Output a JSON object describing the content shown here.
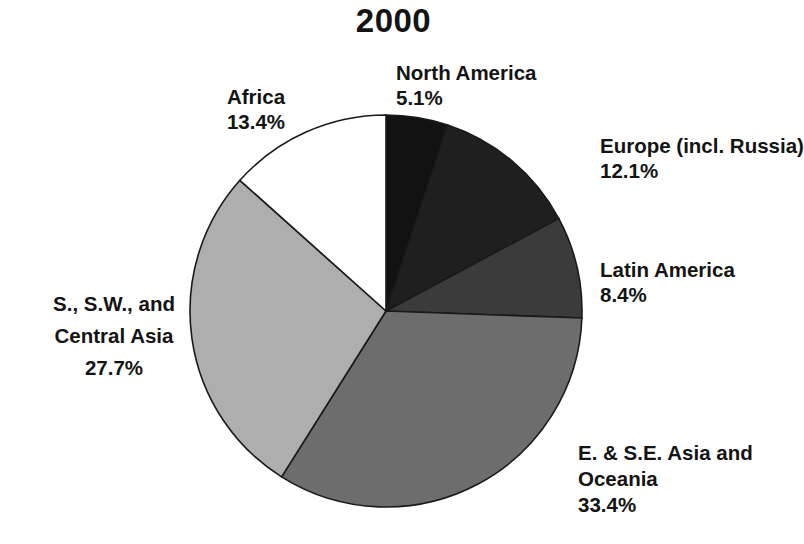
{
  "chart_data": {
    "type": "pie",
    "title": "2000",
    "xlabel": "",
    "ylabel": "",
    "legend_position": "labels-around-pie",
    "grid": false,
    "start_angle_deg": 0,
    "direction": "clockwise",
    "categories": [
      "North America",
      "Europe (incl. Russia)",
      "Latin America",
      "E. & S.E. Asia and Oceania",
      "S., S.W., and Central Asia",
      "Africa"
    ],
    "values": [
      5.1,
      12.1,
      8.4,
      33.4,
      27.7,
      13.4
    ],
    "value_labels": [
      "5.1%",
      "12.1%",
      "8.4%",
      "33.4%",
      "27.7%",
      "13.4%"
    ],
    "slice_colors": [
      "#121212",
      "#1f1f1f",
      "#3b3b3b",
      "#6d6d6d",
      "#aeaeae",
      "#ffffff"
    ],
    "slice_outline_color": "#1a1a1a"
  },
  "chart": {
    "title": "2000",
    "slices": [
      {
        "name": "north-america",
        "label": "North America",
        "pct": "5.1%",
        "value": 5.1,
        "color": "#121212"
      },
      {
        "name": "europe",
        "label": "Europe (incl. Russia)",
        "pct": "12.1%",
        "value": 12.1,
        "color": "#1f1f1f"
      },
      {
        "name": "latin-america",
        "label": "Latin America",
        "pct": "8.4%",
        "value": 8.4,
        "color": "#3b3b3b"
      },
      {
        "name": "ese-asia",
        "label": "E. & S.E. Asia and",
        "label2": "Oceania",
        "pct": "33.4%",
        "value": 33.4,
        "color": "#6d6d6d"
      },
      {
        "name": "s-asia",
        "label": "S., S.W., and",
        "label2": "Central Asia",
        "pct": "27.7%",
        "value": 27.7,
        "color": "#aeaeae"
      },
      {
        "name": "africa",
        "label": "Africa",
        "pct": "13.4%",
        "value": 13.4,
        "color": "#ffffff"
      }
    ]
  }
}
